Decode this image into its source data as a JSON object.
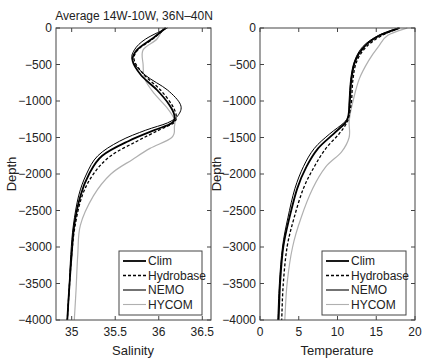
{
  "chart_data": [
    {
      "type": "line",
      "title": "Average 14W-10W, 36N–40N",
      "xlabel": "Salinity",
      "ylabel": "Depth",
      "xlim": [
        34.82,
        36.6
      ],
      "ylim": [
        -4000,
        0
      ],
      "xticks": [
        "35",
        "35.5",
        "36",
        "36.5"
      ],
      "xtick_values": [
        35,
        35.5,
        36,
        36.5
      ],
      "yticks": [
        "0",
        "-500",
        "-1000",
        "-1500",
        "-2000",
        "-2500",
        "-3000",
        "-3500",
        "-4000"
      ],
      "ytick_values": [
        0,
        -500,
        -1000,
        -1500,
        -2000,
        -2500,
        -3000,
        -3500,
        -4000
      ],
      "grid": false,
      "legend_position": "lower right",
      "series": [
        {
          "name": "Clim",
          "style": "solid-thick",
          "color": "#000000",
          "x": [
            36.08,
            35.92,
            35.75,
            35.7,
            35.8,
            35.98,
            36.12,
            36.18,
            36.15,
            35.95,
            35.65,
            35.35,
            35.2,
            35.1,
            35.03,
            35.0,
            34.97,
            34.95
          ],
          "y": [
            0,
            -150,
            -300,
            -450,
            -650,
            -850,
            -1050,
            -1200,
            -1300,
            -1400,
            -1550,
            -1750,
            -2000,
            -2300,
            -2700,
            -3100,
            -3600,
            -4000
          ]
        },
        {
          "name": "Hydrobase",
          "style": "dashed",
          "color": "#000000",
          "x": [
            36.08,
            35.93,
            35.76,
            35.72,
            35.84,
            36.02,
            36.15,
            36.2,
            36.17,
            36.0,
            35.75,
            35.45,
            35.25,
            35.12,
            35.04,
            35.0,
            34.97,
            34.95
          ],
          "y": [
            0,
            -150,
            -300,
            -450,
            -650,
            -850,
            -1050,
            -1200,
            -1300,
            -1400,
            -1550,
            -1750,
            -2000,
            -2300,
            -2700,
            -3100,
            -3600,
            -4000
          ]
        },
        {
          "name": "NEMO",
          "style": "solid",
          "color": "#000000",
          "x": [
            36.1,
            35.85,
            35.72,
            35.7,
            35.85,
            36.1,
            36.25,
            36.22,
            36.1,
            35.85,
            35.55,
            35.3,
            35.17,
            35.08,
            35.02,
            34.99,
            34.97,
            34.95
          ],
          "y": [
            0,
            -150,
            -300,
            -450,
            -650,
            -850,
            -1050,
            -1200,
            -1300,
            -1400,
            -1550,
            -1750,
            -2000,
            -2300,
            -2700,
            -3100,
            -3600,
            -4000
          ]
        },
        {
          "name": "HYCOM",
          "style": "solid",
          "color": "#b0b0b0",
          "x": [
            36.05,
            35.98,
            35.82,
            35.82,
            35.84,
            35.95,
            36.1,
            36.18,
            36.18,
            36.15,
            35.9,
            35.7,
            35.45,
            35.25,
            35.1,
            35.07,
            35.05,
            35.03
          ],
          "y": [
            0,
            -150,
            -300,
            -500,
            -700,
            -900,
            -1100,
            -1250,
            -1350,
            -1500,
            -1650,
            -1800,
            -2000,
            -2300,
            -2700,
            -3100,
            -3600,
            -4000
          ]
        }
      ]
    },
    {
      "type": "line",
      "title": "",
      "xlabel": "Temperature",
      "ylabel": "Depth",
      "xlim": [
        0,
        20
      ],
      "ylim": [
        -4000,
        0
      ],
      "xticks": [
        "0",
        "5",
        "10",
        "15",
        "20"
      ],
      "xtick_values": [
        0,
        5,
        10,
        15,
        20
      ],
      "yticks": [
        "0",
        "-500",
        "-1000",
        "-1500",
        "-2000",
        "-2500",
        "-3000",
        "-3500",
        "-4000"
      ],
      "ytick_values": [
        0,
        -500,
        -1000,
        -1500,
        -2000,
        -2500,
        -3000,
        -3500,
        -4000
      ],
      "grid": false,
      "legend_position": "lower right",
      "series": [
        {
          "name": "Clim",
          "style": "solid-thick",
          "color": "#000000",
          "x": [
            18.0,
            15.5,
            13.5,
            12.3,
            11.8,
            11.6,
            11.4,
            11.0,
            9.5,
            7.5,
            6.0,
            4.8,
            3.8,
            3.0,
            2.6,
            2.4
          ],
          "y": [
            0,
            -100,
            -250,
            -450,
            -700,
            -1000,
            -1200,
            -1300,
            -1450,
            -1650,
            -1900,
            -2200,
            -2600,
            -3000,
            -3500,
            -4000
          ]
        },
        {
          "name": "Hydrobase",
          "style": "dashed",
          "color": "#000000",
          "x": [
            18.0,
            15.8,
            13.8,
            12.5,
            12.0,
            11.8,
            11.5,
            11.2,
            10.2,
            8.5,
            7.0,
            5.6,
            4.4,
            3.5,
            3.0,
            2.8
          ],
          "y": [
            0,
            -100,
            -250,
            -450,
            -700,
            -1000,
            -1200,
            -1300,
            -1450,
            -1650,
            -1900,
            -2200,
            -2600,
            -3000,
            -3500,
            -4000
          ]
        },
        {
          "name": "NEMO",
          "style": "solid",
          "color": "#000000",
          "x": [
            17.8,
            15.3,
            13.3,
            12.2,
            11.7,
            11.5,
            11.4,
            10.8,
            9.0,
            7.0,
            5.6,
            4.5,
            3.6,
            2.9,
            2.5,
            2.3
          ],
          "y": [
            0,
            -100,
            -250,
            -450,
            -700,
            -1000,
            -1200,
            -1300,
            -1450,
            -1650,
            -1900,
            -2200,
            -2600,
            -3000,
            -3500,
            -4000
          ]
        },
        {
          "name": "HYCOM",
          "style": "solid",
          "color": "#b0b0b0",
          "x": [
            19.0,
            16.5,
            15.3,
            14.0,
            12.8,
            12.0,
            11.6,
            11.5,
            11.5,
            10.5,
            8.5,
            6.8,
            5.3,
            4.2,
            3.5,
            3.2
          ],
          "y": [
            0,
            -100,
            -250,
            -450,
            -700,
            -1000,
            -1200,
            -1300,
            -1500,
            -1700,
            -1900,
            -2200,
            -2600,
            -3000,
            -3500,
            -4000
          ]
        }
      ]
    }
  ],
  "legend": [
    {
      "label": "Clim",
      "style": "solid-thick",
      "color": "#000000"
    },
    {
      "label": "Hydrobase",
      "style": "dashed",
      "color": "#000000"
    },
    {
      "label": "NEMO",
      "style": "solid",
      "color": "#000000"
    },
    {
      "label": "HYCOM",
      "style": "solid",
      "color": "#b0b0b0"
    }
  ]
}
